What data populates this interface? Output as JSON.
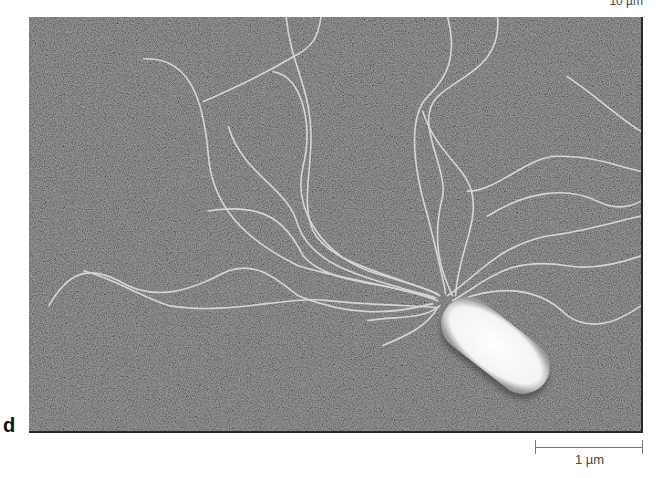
{
  "figure": {
    "panel_label": "d",
    "top_scale_label": "10 µm",
    "scale_bar": {
      "label": "1 µm"
    },
    "colors": {
      "background": "#5a5a5a",
      "cell": "#ffffff",
      "flagella": "#d8d8d8"
    }
  }
}
